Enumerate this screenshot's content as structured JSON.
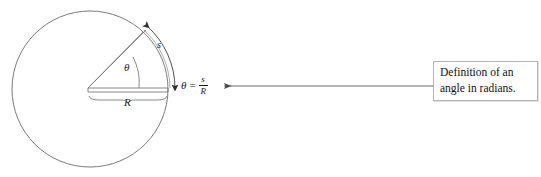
{
  "figure": {
    "type": "geometry-diagram",
    "background_color": "#ffffff",
    "stroke_color": "#555555",
    "text_color": "#1a1a1a",
    "circle": {
      "center_x": 90,
      "center_y": 89,
      "radius": 78,
      "name": "circle-outline"
    },
    "sector": {
      "horizontal_radius_label": "R",
      "angle_label": "θ",
      "arc_label": "s",
      "angle_degrees": 47
    },
    "labels": {
      "theta": "θ",
      "radius": "R",
      "arc": "s"
    },
    "formula": {
      "symbol": "θ",
      "equals": "=",
      "numerator": "s",
      "denominator": "R",
      "full_text": "θ = s/R"
    },
    "connector": {
      "name": "callout-arrow",
      "direction": "left",
      "from_x": 433,
      "to_x": 222,
      "y": 86
    }
  },
  "callout": {
    "border_color": "#b4b4b4",
    "fill_color": "#ffffff",
    "lines": [
      "Definition of an",
      "angle in radians."
    ],
    "text": "Definition of an angle in radians."
  }
}
